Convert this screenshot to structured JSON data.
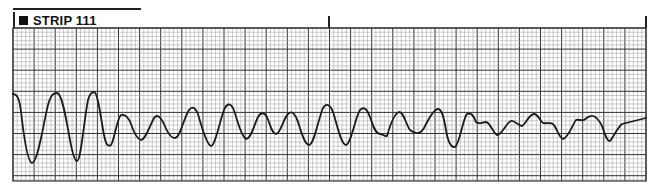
{
  "strip": {
    "label": "STRIP 111",
    "marker_icon": "filled-square",
    "grid": {
      "left": 13,
      "top": 28,
      "right": 646,
      "bottom": 181,
      "major_px": 21.1,
      "minor_per_major": 5,
      "minor_color": "#9a9a9a",
      "major_color": "#333333"
    },
    "time_marks_x": [
      13,
      328,
      646
    ],
    "trace_color": "#1a1a1a"
  }
}
